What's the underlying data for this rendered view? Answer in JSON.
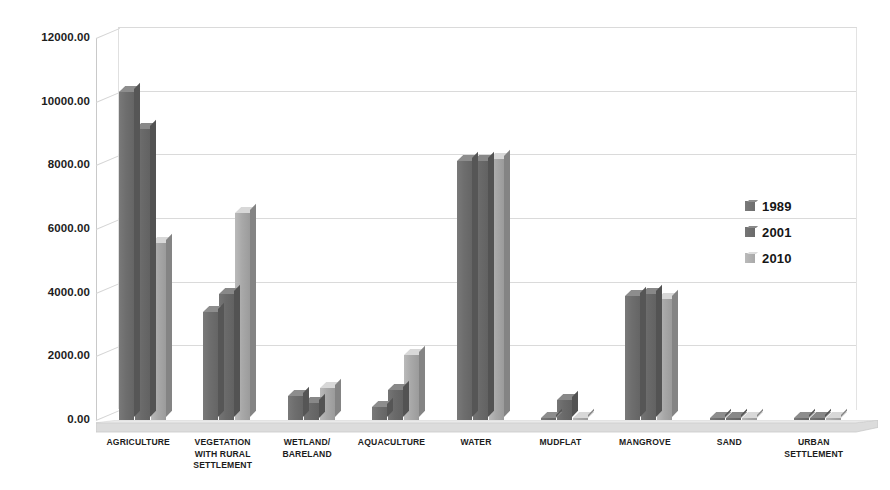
{
  "chart_data": {
    "type": "bar",
    "title": "",
    "subtitle": "",
    "xlabel": "",
    "ylabel": "",
    "ylim": [
      0,
      12000
    ],
    "ytick_labels": [
      "0.00",
      "2000.00",
      "4000.00",
      "6000.00",
      "8000.00",
      "10000.00",
      "12000.00"
    ],
    "ytick_values": [
      0,
      2000,
      4000,
      6000,
      8000,
      10000,
      12000
    ],
    "grid": true,
    "legend_position": "right",
    "style": "3d-clustered-column-grayscale",
    "categories": [
      "AGRICULTURE",
      "VEGETATION WITH RURAL SETTLEMENT",
      "WETLAND/ BARELAND",
      "AQUACULTURE",
      "WATER",
      "MUDFLAT",
      "MANGROVE",
      "SAND",
      "URBAN SETTLEMENT"
    ],
    "category_lines": [
      [
        "AGRICULTURE"
      ],
      [
        "VEGETATION",
        "WITH RURAL",
        "SETTLEMENT"
      ],
      [
        "WETLAND/",
        "BARELAND"
      ],
      [
        "AQUACULTURE"
      ],
      [
        "WATER"
      ],
      [
        "MUDFLAT"
      ],
      [
        "MANGROVE"
      ],
      [
        "SAND"
      ],
      [
        "URBAN",
        "SETTLEMENT"
      ]
    ],
    "series": [
      {
        "name": "1989",
        "color": "#6e6e6e",
        "values": [
          10300,
          3400,
          750,
          400,
          8150,
          60,
          3900,
          30,
          20
        ]
      },
      {
        "name": "2001",
        "color": "#6a6a6a",
        "values": [
          9150,
          3950,
          550,
          950,
          8130,
          620,
          3950,
          30,
          60
        ]
      },
      {
        "name": "2010",
        "color": "#a9a9a9",
        "values": [
          5550,
          6500,
          1000,
          2050,
          8200,
          60,
          3800,
          40,
          60
        ]
      }
    ]
  },
  "legend": {
    "items": [
      {
        "label": "1989",
        "color": "#6e6e6e"
      },
      {
        "label": "2001",
        "color": "#6a6a6a"
      },
      {
        "label": "2010",
        "color": "#a9a9a9"
      }
    ]
  },
  "colors": {
    "background": "#ffffff",
    "gridline": "#dadada",
    "axis": "#c9c9c9",
    "text": "#1d1d1d",
    "floor": "#d8d8d8",
    "series_1989": "#6e6e6e",
    "series_2001": "#6a6a6a",
    "series_2010": "#a9a9a9"
  }
}
